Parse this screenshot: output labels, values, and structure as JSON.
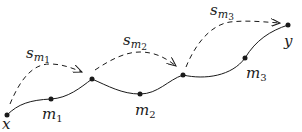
{
  "diagram": {
    "type": "path-with-shortcuts",
    "colors": {
      "ink": "#1a1a1a",
      "background": "#ffffff"
    },
    "nodes": [
      {
        "id": "x",
        "label": "x",
        "x": 7,
        "y": 115
      },
      {
        "id": "m1",
        "label": "m",
        "subscript": "1",
        "x": 51,
        "y": 99
      },
      {
        "id": "a",
        "label": "",
        "x": 92,
        "y": 79
      },
      {
        "id": "m2",
        "label": "m",
        "subscript": "2",
        "x": 140,
        "y": 94
      },
      {
        "id": "b",
        "label": "",
        "x": 183,
        "y": 75
      },
      {
        "id": "m3",
        "label": "m",
        "subscript": "3",
        "x": 245,
        "y": 58
      },
      {
        "id": "y",
        "label": "y",
        "x": 288,
        "y": 25
      }
    ],
    "solid_path": "x → m1 → a → m2 → b → m3 → y",
    "shortcuts": [
      {
        "from": "x",
        "to": "a",
        "label": "s",
        "subscript": "m",
        "subsubscript": "1",
        "style": "dashed-arrow"
      },
      {
        "from": "a",
        "to": "b",
        "label": "s",
        "subscript": "m",
        "subsubscript": "2",
        "style": "dashed-arrow"
      },
      {
        "from": "b",
        "to": "y",
        "label": "s",
        "subscript": "m",
        "subsubscript": "3",
        "style": "dashed-arrow"
      }
    ]
  },
  "labels": {
    "x": "x",
    "y": "y",
    "m1_base": "m",
    "m1_sub": "1",
    "m2_base": "m",
    "m2_sub": "2",
    "m3_base": "m",
    "m3_sub": "3",
    "s1_base": "s",
    "s1_sub": "m",
    "s1_subsub": "1",
    "s2_base": "s",
    "s2_sub": "m",
    "s2_subsub": "2",
    "s3_base": "s",
    "s3_sub": "m",
    "s3_subsub": "3"
  }
}
